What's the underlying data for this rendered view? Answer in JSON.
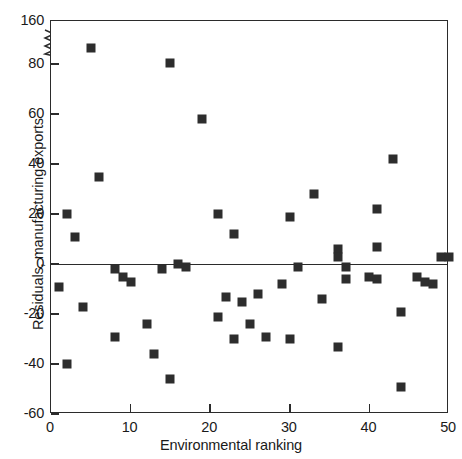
{
  "figure": {
    "background": "#ffffff",
    "marker_color": "#2d2d2d",
    "axis_color": "#2b2b2b"
  },
  "axes": {
    "y_title": "Residuals, manufacturing exports",
    "x_title": "Environmental ranking",
    "y_ticks": [
      160,
      80,
      60,
      40,
      20,
      0,
      -20,
      -40,
      -60
    ],
    "x_ticks": [
      0,
      10,
      20,
      30,
      40,
      50
    ],
    "y_axis_break": {
      "present": true,
      "between": [
        80,
        160
      ],
      "icon": "axis-break-zigzag"
    }
  },
  "chart_data": {
    "type": "scatter",
    "title": "",
    "xlabel": "Environmental ranking",
    "ylabel": "Residuals, manufacturing exports",
    "xlim": [
      0,
      50
    ],
    "ylim": [
      -60,
      160
    ],
    "ytick_labels": [
      "160",
      "80",
      "60",
      "40",
      "20",
      "0",
      "-20",
      "-40",
      "-60"
    ],
    "xtick_labels": [
      "0",
      "10",
      "20",
      "30",
      "40",
      "50"
    ],
    "grid": false,
    "legend": "none",
    "annotations": [
      "zero reference line drawn at y = 0",
      "y-axis broken between 80 and 160"
    ],
    "x": [
      1,
      2,
      2,
      3,
      4,
      5,
      6,
      8,
      8,
      9,
      10,
      12,
      13,
      14,
      15,
      15,
      16,
      17,
      19,
      21,
      21,
      22,
      23,
      23,
      24,
      25,
      26,
      27,
      29,
      30,
      30,
      31,
      33,
      34,
      36,
      36,
      36,
      37,
      37,
      40,
      41,
      41,
      41,
      43,
      44,
      44,
      46,
      47,
      48,
      49,
      50
    ],
    "y": [
      -9,
      -40,
      20,
      11,
      -17,
      110,
      35,
      -29,
      -2,
      -5,
      -7,
      -24,
      -36,
      -2,
      82,
      -46,
      0,
      -1,
      58,
      20,
      -21,
      -13,
      12,
      -30,
      -15,
      -24,
      -12,
      -29,
      -8,
      19,
      -30,
      -1,
      28,
      -14,
      6,
      3,
      -33,
      -1,
      -6,
      -5,
      22,
      7,
      -6,
      42,
      -19,
      -49,
      -5,
      -7,
      -8,
      3,
      3
    ],
    "n_points": 51
  }
}
